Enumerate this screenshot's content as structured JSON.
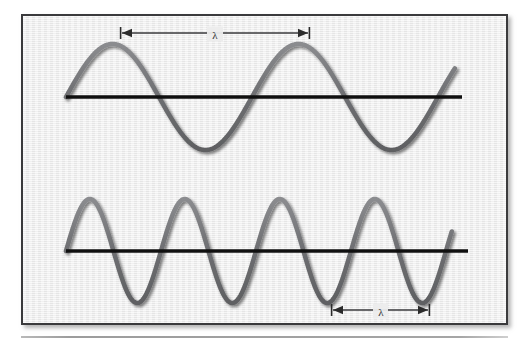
{
  "figure": {
    "background_color": "#ebebeb",
    "border_color": "#3a3a3c",
    "wave_color": "#6f7073",
    "axis_color": "#111111",
    "annotation_color": "#2b2b2b",
    "panel": {
      "x": 21,
      "y": 14,
      "width": 487,
      "height": 311
    },
    "bottom_rule": {
      "x": 21,
      "y": 336,
      "width": 487,
      "color": "#a5a5a5"
    }
  },
  "chart_data": {
    "type": "line",
    "title": "",
    "xlabel": "",
    "ylabel": "",
    "grid": false,
    "legend": null,
    "series": [
      {
        "name": "long-wavelength-wave",
        "description": "Sine wave with long wavelength (low frequency), two full cycles shown",
        "cycles": 2.1,
        "wavelength_px": 186,
        "amplitude_px": 53,
        "baseline_y_px": 97,
        "x_start_px": 66,
        "x_end_px": 455,
        "crest_x_px": [
          122,
          308
        ],
        "trough_x_px": [
          215,
          401
        ],
        "zero_crossings_x_px": [
          66,
          169,
          262,
          355,
          448
        ]
      },
      {
        "name": "short-wavelength-wave",
        "description": "Sine wave with short wavelength (high frequency), approximately four full cycles shown",
        "cycles": 4.1,
        "wavelength_px": 95,
        "amplitude_px": 52,
        "baseline_y_px": 251,
        "x_start_px": 66,
        "x_end_px": 452,
        "crest_x_px": [
          95,
          190,
          285,
          380
        ],
        "trough_x_px": [
          143,
          238,
          333,
          428
        ],
        "zero_crossings_x_px": [
          66,
          119,
          167,
          214,
          262,
          309,
          357,
          404,
          452
        ]
      }
    ]
  },
  "annotations": [
    {
      "id": "top-wavelength-measure",
      "label": "λ",
      "label_name": "lambda",
      "meaning": "wavelength of the upper (long) wave, measured crest to crest",
      "arrow_x_start_px": 122,
      "arrow_x_end_px": 308,
      "arrow_y_px": 33,
      "label_x_px": 215,
      "label_y_px": 34,
      "style": "double-headed-arrow-with-end-ticks"
    },
    {
      "id": "bottom-wavelength-measure",
      "label": "λ",
      "label_name": "lambda",
      "meaning": "wavelength of the lower (short) wave, measured trough to trough",
      "arrow_x_start_px": 333,
      "arrow_x_end_px": 428,
      "arrow_y_px": 310,
      "label_x_px": 381,
      "label_y_px": 311,
      "style": "double-headed-arrow-with-end-ticks"
    }
  ]
}
